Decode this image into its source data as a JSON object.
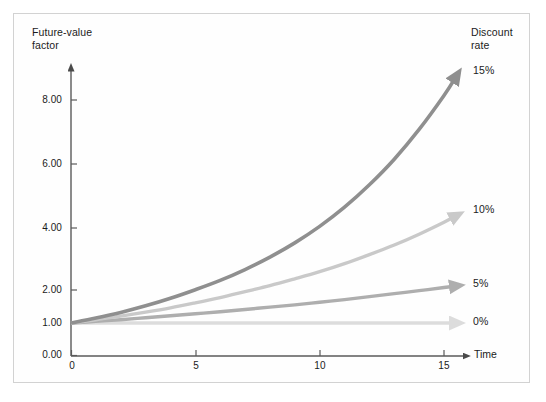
{
  "figure": {
    "background_color": "#ffffff",
    "frame_color": "#d2d2d2"
  },
  "axes": {
    "y_title": "Future-value\nfactor",
    "x_title": "Time",
    "y_tick_labels": [
      "0.00",
      "1.00",
      "2.00",
      "4.00",
      "6.00",
      "8.00"
    ],
    "x_tick_labels": [
      "0",
      "5",
      "10",
      "15"
    ]
  },
  "legend": {
    "title": "Discount\nrate",
    "entries": [
      {
        "label": "15%",
        "color": "#8f8f8f"
      },
      {
        "label": "10%",
        "color": "#c9c9c9"
      },
      {
        "label": "5%",
        "color": "#aeaeae"
      },
      {
        "label": "0%",
        "color": "#dcdcdc"
      }
    ]
  },
  "chart_data": {
    "type": "line",
    "title": "",
    "subtitle": "",
    "xlabel": "Time",
    "ylabel": "Future-value factor",
    "xlim": [
      0,
      16
    ],
    "ylim": [
      0,
      9
    ],
    "xticks": [
      0,
      5,
      10,
      15
    ],
    "yticks": [
      0.0,
      1.0,
      2.0,
      4.0,
      6.0,
      8.0
    ],
    "grid": false,
    "legend_position": "right",
    "x": [
      0,
      1,
      2,
      3,
      4,
      5,
      6,
      7,
      8,
      9,
      10,
      11,
      12,
      13,
      14,
      15,
      16
    ],
    "series": [
      {
        "name": "15%",
        "color": "#8f8f8f",
        "values": [
          1.0,
          1.15,
          1.32,
          1.52,
          1.75,
          2.01,
          2.31,
          2.66,
          3.06,
          3.52,
          4.05,
          4.65,
          5.35,
          6.15,
          7.08,
          8.14,
          9.36
        ]
      },
      {
        "name": "10%",
        "color": "#c9c9c9",
        "values": [
          1.0,
          1.1,
          1.21,
          1.33,
          1.46,
          1.61,
          1.77,
          1.95,
          2.14,
          2.36,
          2.59,
          2.85,
          3.14,
          3.45,
          3.8,
          4.18,
          4.59
        ]
      },
      {
        "name": "5%",
        "color": "#aeaeae",
        "values": [
          1.0,
          1.05,
          1.1,
          1.16,
          1.22,
          1.28,
          1.34,
          1.41,
          1.48,
          1.55,
          1.63,
          1.71,
          1.8,
          1.89,
          1.98,
          2.08,
          2.18
        ]
      },
      {
        "name": "0%",
        "color": "#dcdcdc",
        "values": [
          1.0,
          1.0,
          1.0,
          1.0,
          1.0,
          1.0,
          1.0,
          1.0,
          1.0,
          1.0,
          1.0,
          1.0,
          1.0,
          1.0,
          1.0,
          1.0,
          1.0
        ]
      }
    ]
  }
}
